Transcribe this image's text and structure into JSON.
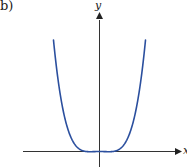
{
  "figure": {
    "panel_label": "b)",
    "x_axis_label": "x",
    "y_axis_label": "y",
    "curve_color": "#2b4f9e",
    "axis_color": "#333333"
  },
  "chart_data": {
    "type": "line",
    "title": "",
    "panel": "b)",
    "xlabel": "x",
    "ylabel": "y",
    "grid": false,
    "legend": null,
    "series": [
      {
        "name": "y = f(x)",
        "x": [
          -1.0,
          -0.9,
          -0.8,
          -0.7,
          -0.6,
          -0.5,
          -0.4,
          -0.3,
          -0.2,
          -0.1,
          0.0,
          0.1,
          0.2,
          0.3,
          0.4,
          0.5,
          0.6,
          0.7,
          0.8,
          0.9,
          1.0
        ],
        "values": [
          1.0,
          0.62,
          0.36,
          0.18,
          0.06,
          -0.01,
          -0.04,
          -0.04,
          -0.025,
          -0.008,
          0.0,
          -0.008,
          -0.025,
          -0.04,
          -0.04,
          -0.01,
          0.06,
          0.18,
          0.36,
          0.62,
          1.0
        ]
      }
    ],
    "axis_ticks": "none shown",
    "ylim": [
      -0.15,
      1.1
    ],
    "xlim": [
      -1.4,
      1.6
    ]
  }
}
